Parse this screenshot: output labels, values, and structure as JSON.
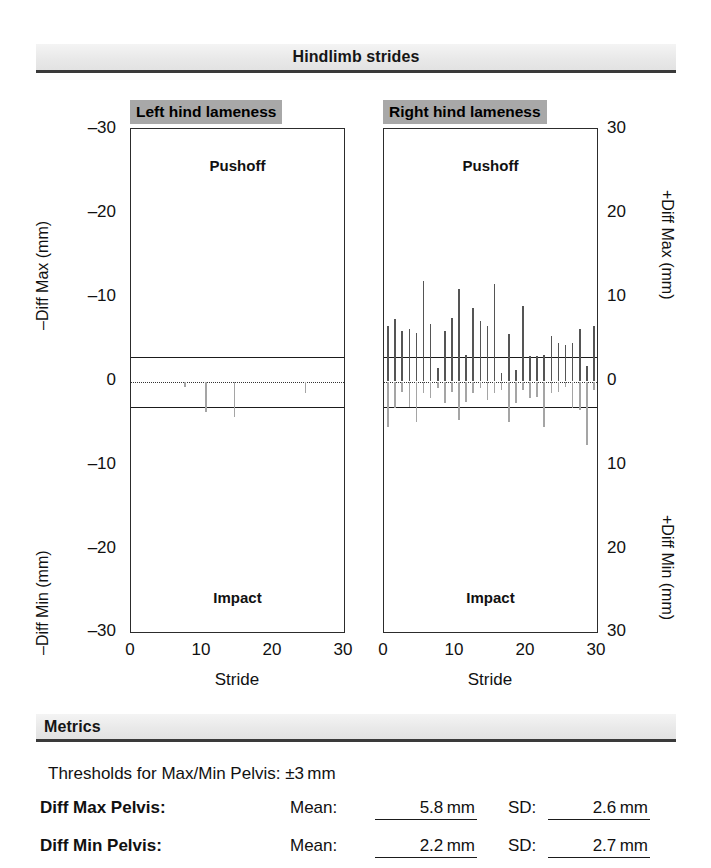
{
  "header": {
    "title": "Hindlimb strides"
  },
  "axes": {
    "x_ticks": [
      "0",
      "10",
      "20",
      "30"
    ],
    "x_title": "Stride",
    "left_ticks_top": [
      "–30",
      "–20",
      "–10"
    ],
    "left_tick_zero": "0",
    "left_ticks_bottom": [
      "–10",
      "–20",
      "–30"
    ],
    "right_ticks_top": [
      "30",
      "20",
      "10"
    ],
    "right_tick_zero": "0",
    "right_ticks_bottom": [
      "10",
      "20",
      "30"
    ],
    "left_title_top": "–Diff Max (mm)",
    "left_title_bottom": "–Diff Min (mm)",
    "right_title_top": "+Diff Max (mm)",
    "right_title_bottom": "+Diff Min (mm)",
    "zone_top": "Pushoff",
    "zone_bottom": "Impact"
  },
  "panels": [
    {
      "title": "Left hind lameness"
    },
    {
      "title": "Right hind lameness"
    }
  ],
  "metrics": {
    "title": "Metrics",
    "threshold_text": "Thresholds for Max/Min Pelvis: ±3 mm",
    "mean_label": "Mean:",
    "sd_label": "SD:",
    "rows": [
      {
        "label": "Diff Max Pelvis:",
        "mean": "5.8 mm",
        "sd": "2.6 mm"
      },
      {
        "label": "Diff Min Pelvis:",
        "mean": "2.2 mm",
        "sd": "2.7 mm"
      }
    ]
  },
  "chart_data": {
    "type": "bar",
    "title": "Hindlimb strides",
    "xlabel": "Stride",
    "xlim": [
      0,
      30
    ],
    "ylim_max": [
      0,
      30
    ],
    "ylim_min": [
      0,
      30
    ],
    "threshold_mm": 3,
    "zero_line": 0,
    "grid": false,
    "legend": "none",
    "colors": {
      "diff_max": "#555555",
      "diff_min": "#a5a5a5",
      "threshold_line": "#1b1b1b",
      "panel_title_bg": "#a8a8a8"
    },
    "panels": [
      {
        "name": "Left hind lameness",
        "ylabel_top": "–Diff Max (mm)",
        "ylabel_bottom": "–Diff Min (mm)",
        "series": [
          {
            "name": "Diff Max",
            "values": [
              0,
              0,
              0,
              0,
              0,
              0,
              0,
              0,
              0,
              0,
              0,
              0,
              0,
              0,
              0,
              0,
              0,
              0,
              0,
              0,
              0,
              0,
              0,
              0,
              0,
              0,
              0,
              0,
              0,
              0
            ]
          },
          {
            "name": "Diff Min",
            "values": [
              0,
              0,
              0,
              0,
              0,
              0,
              0,
              0.6,
              0,
              0,
              3.6,
              0,
              0,
              0,
              4.2,
              0,
              0,
              0,
              0,
              0,
              0,
              0,
              0,
              0,
              1.4,
              0,
              0,
              0,
              0,
              0
            ]
          }
        ]
      },
      {
        "name": "Right hind lameness",
        "ylabel_top": "+Diff Max (mm)",
        "ylabel_bottom": "+Diff Min (mm)",
        "series": [
          {
            "name": "Diff Max",
            "values": [
              6.6,
              7.4,
              6.0,
              6.2,
              5.8,
              12.0,
              6.8,
              1.6,
              6.0,
              7.6,
              11.0,
              3.2,
              8.8,
              7.2,
              6.6,
              11.6,
              1.0,
              5.6,
              1.4,
              9.0,
              3.0,
              3.0,
              3.2,
              5.4,
              4.6,
              4.4,
              4.6,
              6.2,
              1.8,
              6.6
            ]
          },
          {
            "name": "Diff Min",
            "values": [
              5.4,
              3.2,
              1.2,
              3.0,
              4.8,
              1.4,
              2.0,
              0.8,
              2.6,
              1.2,
              4.6,
              2.4,
              1.4,
              0.8,
              2.2,
              1.4,
              1.0,
              4.8,
              2.6,
              1.0,
              2.0,
              1.8,
              5.4,
              1.4,
              1.2,
              0.6,
              3.2,
              3.4,
              7.6,
              1.0
            ]
          }
        ]
      }
    ]
  }
}
